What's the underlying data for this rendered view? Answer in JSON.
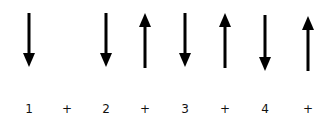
{
  "diagram": {
    "stroke_color": "#000000",
    "columns": [
      {
        "label": "1",
        "x": 29,
        "arrow": "down",
        "y1": 13,
        "y2": 67
      },
      {
        "label": "+",
        "x": 67,
        "arrow": "none",
        "y1": 0,
        "y2": 0
      },
      {
        "label": "2",
        "x": 106,
        "arrow": "down",
        "y1": 13,
        "y2": 67
      },
      {
        "label": "+",
        "x": 145,
        "arrow": "up",
        "y1": 13,
        "y2": 68
      },
      {
        "label": "3",
        "x": 185,
        "arrow": "down",
        "y1": 13,
        "y2": 67
      },
      {
        "label": "+",
        "x": 225,
        "arrow": "up",
        "y1": 13,
        "y2": 68
      },
      {
        "label": "4",
        "x": 265,
        "arrow": "down",
        "y1": 15,
        "y2": 71
      },
      {
        "label": "+",
        "x": 308,
        "arrow": "up",
        "y1": 16,
        "y2": 71
      }
    ]
  }
}
